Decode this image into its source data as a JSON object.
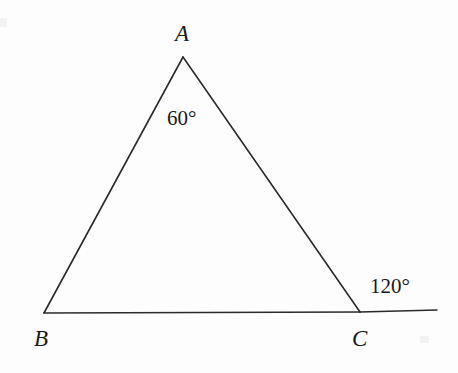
{
  "figure": {
    "kind": "geometry-diagram",
    "background_color": "#fdfdfd",
    "stroke_color": "#2b2b2b",
    "text_color": "#1a1a1a"
  },
  "chart_data": {
    "type": "diagram",
    "title": "",
    "points": [
      {
        "name": "A",
        "x": 183,
        "y": 57
      },
      {
        "name": "B",
        "x": 44,
        "y": 313
      },
      {
        "name": "C",
        "x": 360,
        "y": 312
      },
      {
        "name": "D",
        "x": 437,
        "y": 310
      }
    ],
    "segments": [
      {
        "from": "A",
        "to": "B"
      },
      {
        "from": "A",
        "to": "C"
      },
      {
        "from": "B",
        "to": "C"
      },
      {
        "from": "C",
        "to": "D"
      }
    ],
    "angles": [
      {
        "at": "A",
        "value": 60,
        "unit": "degrees",
        "kind": "interior",
        "label": "60°"
      },
      {
        "at": "C",
        "value": 120,
        "unit": "degrees",
        "kind": "exterior",
        "label": "120°"
      }
    ]
  },
  "labels": {
    "vertex_a": "A",
    "vertex_b": "B",
    "vertex_c": "C",
    "angle_at_a": "60°",
    "exterior_angle_at_c": "120°"
  }
}
